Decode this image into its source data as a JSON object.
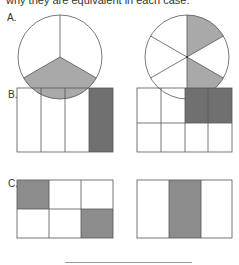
{
  "instruction_text": "why they are equivalent in each case.",
  "sections": [
    {
      "label": "A.",
      "left": {
        "shape": "circle",
        "parts": 3,
        "shaded": [
          1
        ],
        "fraction": "1/3"
      },
      "right": {
        "shape": "circle",
        "parts": 6,
        "shaded": [
          0,
          2
        ],
        "fraction": "2/6"
      }
    },
    {
      "label": "B.",
      "left": {
        "shape": "rectangle",
        "rows": 1,
        "cols": 4,
        "shaded_cells": [
          [
            0,
            3
          ]
        ],
        "fraction": "1/4"
      },
      "right": {
        "shape": "rectangle",
        "rows": 2,
        "cols": 4,
        "shaded_cells": [
          [
            0,
            2
          ],
          [
            0,
            3
          ]
        ],
        "fraction": "2/8"
      }
    },
    {
      "label": "C.",
      "left": {
        "shape": "rectangle",
        "rows": 2,
        "cols": 3,
        "shaded_cells": [
          [
            0,
            0
          ],
          [
            1,
            2
          ]
        ],
        "fraction": "2/6"
      },
      "right": {
        "shape": "rectangle",
        "rows": 1,
        "cols": 3,
        "shaded_cells": [
          [
            0,
            1
          ]
        ],
        "fraction": "1/3"
      }
    }
  ],
  "colors": {
    "stroke": "#555555",
    "shade_light": "#a9a9a9",
    "shade_dark": "#707070",
    "shade_mid": "#8c8c8c"
  }
}
